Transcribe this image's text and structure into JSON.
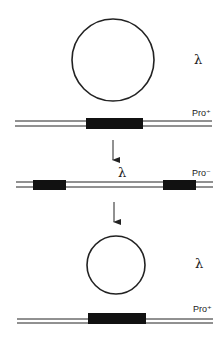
{
  "diagram": {
    "type": "lambda-prophage-excision",
    "colors": {
      "stroke": "#222222",
      "gene_block": "#111111",
      "background": "#ffffff"
    },
    "stages": [
      {
        "id": "top",
        "phage_label": "λ",
        "phage_circle": {
          "cx": 113,
          "cy": 60,
          "r": 41
        },
        "chromosome_label": "Pro⁺",
        "chromosome": {
          "x1": 15,
          "x2": 212,
          "y1": 121,
          "y2": 126
        },
        "gene_blocks": [
          {
            "x": 86,
            "y": 118,
            "w": 57,
            "h": 11
          }
        ]
      },
      {
        "id": "middle",
        "insert_label": "λ",
        "chromosome_label": "Pro⁻",
        "chromosome": {
          "x1": 16,
          "x2": 213,
          "y1": 182,
          "y2": 187
        },
        "gene_blocks": [
          {
            "x": 33,
            "y": 180,
            "w": 33,
            "h": 10
          },
          {
            "x": 163,
            "y": 180,
            "w": 33,
            "h": 10
          }
        ]
      },
      {
        "id": "bottom",
        "phage_label": "λ",
        "phage_circle": {
          "cx": 116,
          "cy": 265,
          "r": 29
        },
        "chromosome_label": "Pro⁺",
        "chromosome": {
          "x1": 17,
          "x2": 213,
          "y1": 319,
          "y2": 323
        },
        "gene_blocks": [
          {
            "x": 88,
            "y": 313,
            "w": 58,
            "h": 11
          }
        ]
      }
    ],
    "arrows": [
      {
        "x": 113,
        "y1": 140,
        "y2": 166
      },
      {
        "x": 114,
        "y1": 202,
        "y2": 228
      }
    ]
  }
}
